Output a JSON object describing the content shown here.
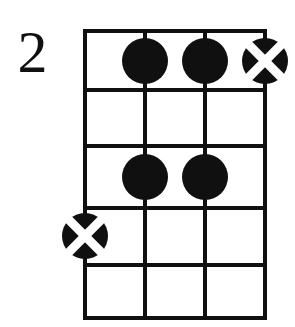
{
  "diagram": {
    "kind": "chord-diagram",
    "instrument_strings": 4,
    "position_label": "2",
    "colors": {
      "ink": "#101010",
      "background": "#ffffff",
      "marker_fill": "#101010",
      "marker_cross": "#ffffff"
    },
    "geometry": {
      "left": 85,
      "right": 265,
      "top": 31,
      "bottom": 318,
      "string_x": [
        85,
        145,
        205,
        265
      ],
      "fret_y": [
        31,
        90,
        146,
        208,
        265,
        318
      ],
      "line_width": 4,
      "nut_width": 4,
      "marker_radius": 23,
      "cross_arm_width": 9
    },
    "strings": [
      {
        "index": 1,
        "x": 85
      },
      {
        "index": 2,
        "x": 145
      },
      {
        "index": 3,
        "x": 205
      },
      {
        "index": 4,
        "x": 265
      }
    ],
    "frets": [
      {
        "index": 0,
        "y": 31,
        "is_nut": true
      },
      {
        "index": 1,
        "y": 90,
        "is_nut": false
      },
      {
        "index": 2,
        "y": 146,
        "is_nut": false
      },
      {
        "index": 3,
        "y": 208,
        "is_nut": false
      },
      {
        "index": 4,
        "y": 265,
        "is_nut": false
      },
      {
        "index": 5,
        "y": 318,
        "is_nut": false
      }
    ],
    "markers": [
      {
        "name": "dot-fret1-string2",
        "type": "dot",
        "string": 2,
        "fret": 1,
        "cx": 145,
        "cy": 61,
        "r": 23
      },
      {
        "name": "dot-fret1-string3",
        "type": "dot",
        "string": 3,
        "fret": 1,
        "cx": 205,
        "cy": 61,
        "r": 23
      },
      {
        "name": "cross-fret1-string4",
        "type": "cross",
        "string": 4,
        "fret": 1,
        "cx": 265,
        "cy": 61,
        "r": 23
      },
      {
        "name": "dot-fret3-string2",
        "type": "dot",
        "string": 2,
        "fret": 3,
        "cx": 145,
        "cy": 177,
        "r": 23
      },
      {
        "name": "dot-fret3-string3",
        "type": "dot",
        "string": 3,
        "fret": 3,
        "cx": 205,
        "cy": 177,
        "r": 23
      },
      {
        "name": "cross-fret4-string1",
        "type": "cross",
        "string": 1,
        "fret": 4,
        "cx": 85,
        "cy": 236,
        "r": 23
      }
    ]
  }
}
